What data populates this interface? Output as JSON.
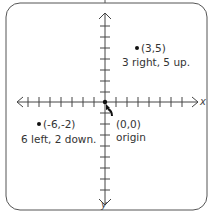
{
  "diagram": {
    "type": "coordinate-plane",
    "axes": {
      "x_label": "x",
      "y_label": "y"
    },
    "points": [
      {
        "coord": "(3,5)",
        "desc": "3 right, 5 up.",
        "x": 3,
        "y": 5
      },
      {
        "coord": "(-6,-2)",
        "desc": "6 left, 2 down.",
        "x": -6,
        "y": -2
      },
      {
        "coord": "(0,0)",
        "desc": "origin",
        "x": 0,
        "y": 0
      }
    ],
    "colors": {
      "line": "#555555",
      "point": "#111111"
    }
  }
}
